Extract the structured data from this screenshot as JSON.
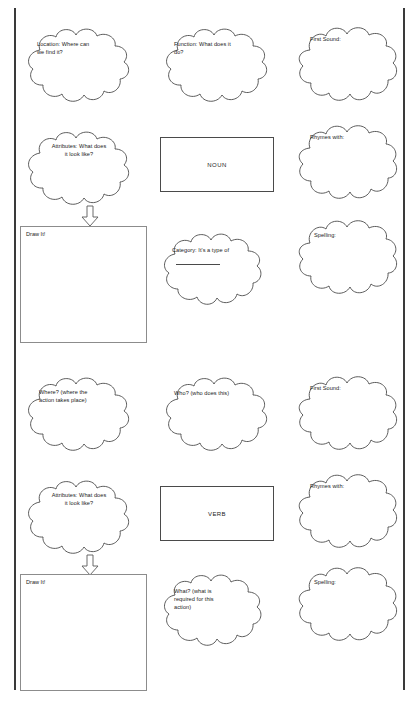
{
  "document": {
    "title": "Noun and Verb Semantic Map Worksheet",
    "page_border_color": "#3a3a3a",
    "ink_color": "#1b1b1b",
    "outline_color": "#4a4a4a"
  },
  "sections": [
    {
      "id": "noun",
      "center_label": "NOUN",
      "clouds": [
        {
          "id": "noun-location",
          "text": "Location: Where can\nwe find it?",
          "align": "left"
        },
        {
          "id": "noun-function",
          "text": "Function: What does it\ndo?",
          "align": "left"
        },
        {
          "id": "noun-first-sound",
          "text": "First Sound:",
          "align": "left"
        },
        {
          "id": "noun-attributes",
          "text": "Attributes: What does\nit look like?",
          "align": "center"
        },
        {
          "id": "noun-rhymes",
          "text": "Rhymes with:",
          "align": "left"
        },
        {
          "id": "noun-category",
          "text": "Category: It's a type of",
          "align": "left"
        },
        {
          "id": "noun-spelling",
          "text": "Spelling:",
          "align": "left"
        }
      ],
      "draw_box_label": "Draw It!"
    },
    {
      "id": "verb",
      "center_label": "VERB",
      "clouds": [
        {
          "id": "verb-where",
          "text": "Where? (where the\naction takes place)",
          "align": "left"
        },
        {
          "id": "verb-who",
          "text": "Who? (who does this)",
          "align": "left"
        },
        {
          "id": "verb-first-sound",
          "text": "First Sound:",
          "align": "left"
        },
        {
          "id": "verb-attributes",
          "text": "Attributes: What does\nit look like?",
          "align": "center"
        },
        {
          "id": "verb-rhymes",
          "text": "Rhymes with:",
          "align": "left"
        },
        {
          "id": "verb-what",
          "text": "What? (what is\nrequired for this\naction)",
          "align": "left"
        },
        {
          "id": "verb-spelling",
          "text": "Spelling:",
          "align": "left"
        }
      ],
      "draw_box_label": "Draw It!"
    }
  ]
}
